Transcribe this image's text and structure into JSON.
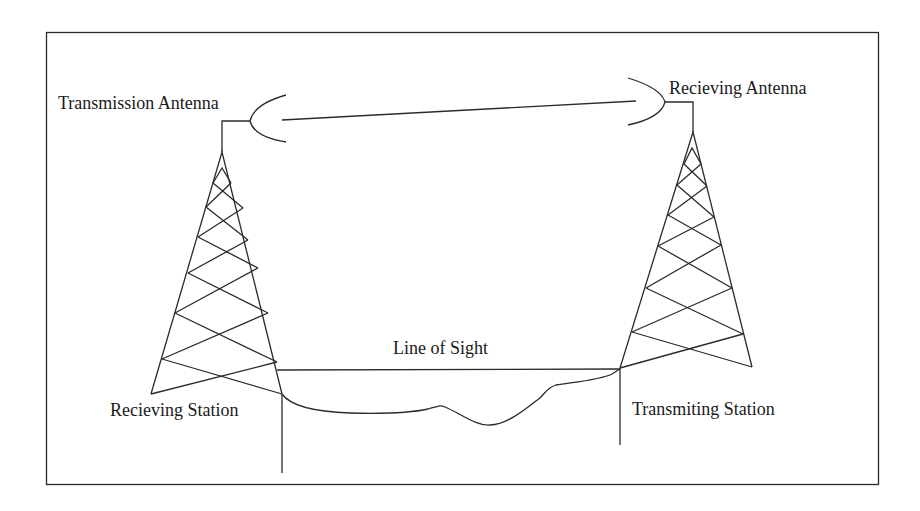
{
  "diagram": {
    "type": "line-of-sight microwave link",
    "labels": {
      "transmission_antenna": "Transmission Antenna",
      "recieving_antenna": "Recieving Antenna",
      "line_of_sight": "Line of Sight",
      "recieving_station": "Recieving Station",
      "transmiting_station": "Transmiting Station"
    },
    "colors": {
      "stroke": "#2b2b2b",
      "text": "#1a1a1a",
      "background": "#ffffff"
    }
  }
}
